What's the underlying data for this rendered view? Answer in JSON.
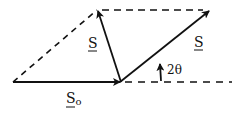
{
  "diagram": {
    "type": "vector-parallelogram",
    "colors": {
      "stroke": "#111111",
      "background": "#ffffff"
    },
    "vectors": [
      {
        "id": "S0",
        "label": "S",
        "subscript": "o",
        "from": [
          13,
          82
        ],
        "to": [
          120,
          82
        ]
      },
      {
        "id": "S_prime",
        "label": "S",
        "from": [
          120,
          82
        ],
        "to": [
          97,
          10
        ]
      },
      {
        "id": "S",
        "label": "S",
        "from": [
          120,
          82
        ],
        "to": [
          210,
          10
        ]
      }
    ],
    "dashed_lines": [
      {
        "from": [
          13,
          82
        ],
        "to": [
          97,
          10
        ]
      },
      {
        "from": [
          97,
          10
        ],
        "to": [
          210,
          10
        ]
      },
      {
        "from": [
          120,
          82
        ],
        "to": [
          232,
          82
        ]
      }
    ],
    "angle": {
      "label": "2θ",
      "description": "angle between S and horizontal"
    },
    "labels": {
      "s_left": "S",
      "s_right": "S",
      "s0_main": "S",
      "s0_sub": "o",
      "angle": "2θ"
    }
  }
}
